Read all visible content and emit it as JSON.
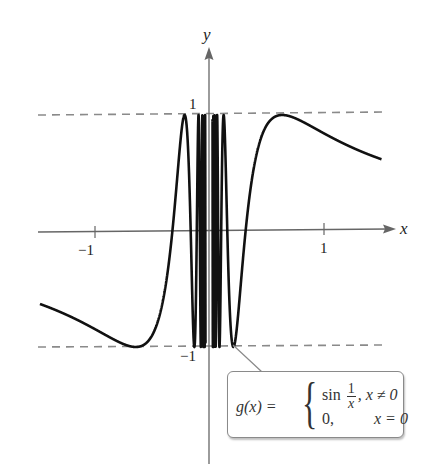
{
  "chart_data": {
    "type": "line",
    "title": "",
    "function_label": "g(x)",
    "piecewise": [
      {
        "expr": "sin 1/x",
        "condition": "x ≠ 0"
      },
      {
        "expr": "0",
        "condition": "x = 0"
      }
    ],
    "xlabel": "x",
    "ylabel": "y",
    "xlim": [
      -1.47,
      1.5
    ],
    "ylim": [
      -1.1,
      1.45
    ],
    "x_ticks": [
      -1,
      1
    ],
    "x_tick_labels": [
      "−1",
      "1"
    ],
    "y_tick_labels": [
      "1",
      "−1"
    ],
    "y_ticks": [
      1,
      -1
    ],
    "reference_lines": [
      {
        "y": 1,
        "style": "dashed"
      },
      {
        "y": -1,
        "style": "dashed"
      }
    ],
    "series": [
      {
        "name": "g(x) = sin(1/x)",
        "function": "sin(1/x)",
        "x_range": [
          -1.47,
          1.5
        ],
        "color": "#111111"
      }
    ],
    "grid": false,
    "legend": "callout box, bottom-right"
  },
  "labels": {
    "y_axis": "y",
    "x_axis": "x",
    "tick_neg1_x": "−1",
    "tick_pos1_x": "1",
    "tick_pos1_y": "1",
    "tick_neg1_y": "−1"
  },
  "callout": {
    "lhs": "g(x) =",
    "row1_fn": "sin",
    "row1_num": "1",
    "row1_den": "x",
    "row1_cond": ", x ≠ 0",
    "row2_val": "0,",
    "row2_cond": "x = 0",
    "brace": "{"
  },
  "colors": {
    "curve": "#111111",
    "axis": "#666666",
    "dashed": "#888888",
    "callout_border": "#8a8a8a"
  }
}
